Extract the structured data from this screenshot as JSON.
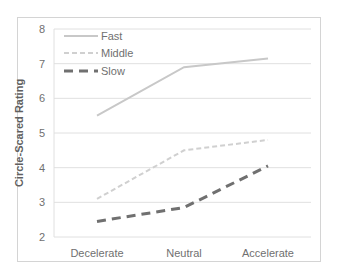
{
  "chart_data": {
    "type": "line",
    "title": "",
    "xlabel": "",
    "ylabel": "Circle-Scared Rating",
    "categories": [
      "Decelerate",
      "Neutral",
      "Accelerate"
    ],
    "series": [
      {
        "name": "Fast",
        "values": [
          5.5,
          6.9,
          7.15
        ],
        "color": "#c8c8c8",
        "dash": "solid"
      },
      {
        "name": "Middle",
        "values": [
          3.1,
          4.5,
          4.8
        ],
        "color": "#d0d0d0",
        "dash": "dashed-short"
      },
      {
        "name": "Slow",
        "values": [
          2.45,
          2.85,
          4.05
        ],
        "color": "#707070",
        "dash": "dashed-long"
      }
    ],
    "ylim": [
      2,
      8
    ],
    "yticks": [
      "2",
      "3",
      "4",
      "5",
      "6",
      "7",
      "8"
    ],
    "grid": true,
    "legend_position": "upper-left inside"
  }
}
